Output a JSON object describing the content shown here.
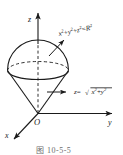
{
  "figure": {
    "background_color": "#ffffff",
    "stroke_color": "#1a1a1a",
    "axes": {
      "z_label": "z",
      "y_label": "y",
      "x_label": "x",
      "origin_label": "O"
    },
    "annotations": {
      "sphere": {
        "name": "sphere-equation",
        "var_x": "x",
        "var_y": "y",
        "var_z": "z",
        "exp_x": "2",
        "exp_y": "2",
        "exp_z": "2",
        "plus_1": "+",
        "plus_2": "+",
        "equals": "=",
        "rhs_var": "R",
        "rhs_exp": "2",
        "full_text": "x2+y2+z2=R2"
      },
      "cone": {
        "name": "cone-equation",
        "lhs_var": "z",
        "equals": "=",
        "radical": "√",
        "var_x": "x",
        "exp_x": "2",
        "plus": "+",
        "var_y": "y",
        "exp_y": "2",
        "full_text": "z=√(x2+y2)"
      }
    },
    "caption": "图 10-5-5"
  }
}
